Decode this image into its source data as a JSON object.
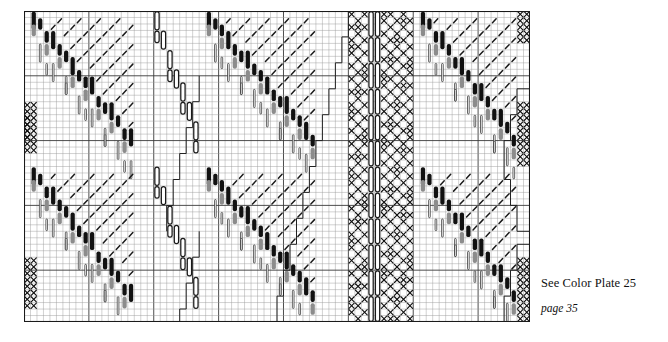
{
  "caption": {
    "plate_reference": "See Color Plate 25",
    "page_reference": "page 35"
  },
  "chart_data": {
    "type": "table",
    "title": "",
    "grid": {
      "columns": 78,
      "rows": 48,
      "cell_width": 6.49,
      "cell_height": 6.48,
      "left": 24,
      "top": 11,
      "width": 506,
      "height": 311,
      "grid_on": true,
      "minor_line_color": "#9a9a9a",
      "major_line_color": "#3a3a3a",
      "major_every_cols": 10,
      "major_every_rows": 10,
      "border_color": "#1a1a1a"
    },
    "symbols": [
      {
        "key": "black_bar",
        "label": "filled black bar",
        "color": "#111111"
      },
      {
        "key": "gray_bar",
        "label": "gray filled bar",
        "color": "#8c8c8c"
      },
      {
        "key": "thin_bar",
        "label": "thin outlined bar",
        "color": "#222222"
      },
      {
        "key": "capsule",
        "label": "open oval capsule",
        "color": "#1a1a1a"
      },
      {
        "key": "cross",
        "label": "X mark",
        "color": "#111111"
      },
      {
        "key": "slash",
        "label": "diagonal slash",
        "color": "#1b1b1b"
      },
      {
        "key": "step_line",
        "label": "stepped outline path",
        "color": "#222222"
      }
    ],
    "motif_bands": [
      {
        "name": "band-left",
        "x_start": 0,
        "x_end": 26,
        "motif": "diagonal-bar-wave"
      },
      {
        "name": "band-mid",
        "x_start": 26,
        "x_end": 50,
        "motif": "diagonal-bar-wave"
      },
      {
        "name": "band-cross",
        "x_start": 50,
        "x_end": 60,
        "motif": "cross-capsule-column"
      },
      {
        "name": "band-right",
        "x_start": 60,
        "x_end": 78,
        "motif": "diagonal-bar-wave"
      }
    ],
    "repeat_vertical": 2,
    "xlabel": "",
    "ylabel": "",
    "legend_position": "none"
  }
}
